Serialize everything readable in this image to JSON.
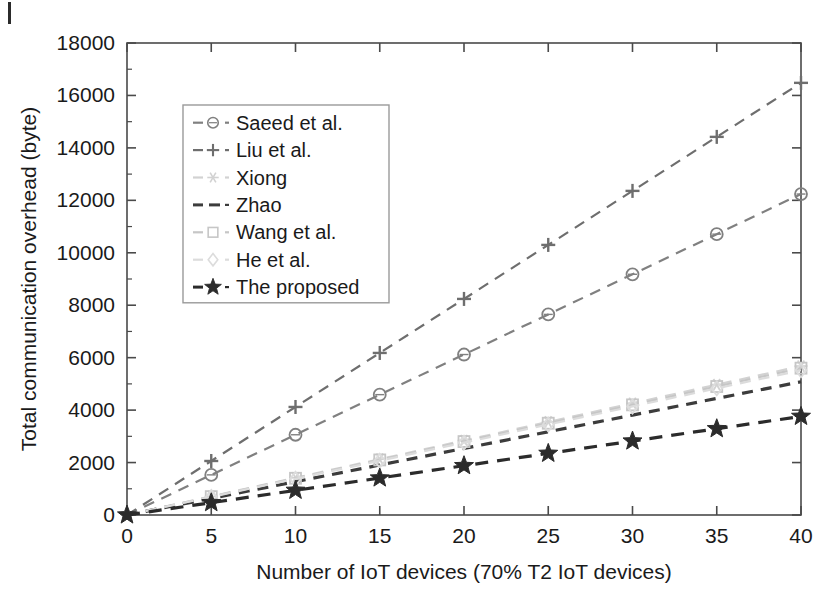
{
  "figure": {
    "background_color": "#ffffff",
    "axis_color": "#4a4a4a",
    "corner_artifact": "scan-artifact"
  },
  "chart_data": {
    "type": "line",
    "title": "",
    "xlabel": "Number of IoT devices (70% T2 IoT devices)",
    "ylabel": "Total communication overhead (byte)",
    "x": [
      0,
      5,
      10,
      15,
      20,
      25,
      30,
      35,
      40
    ],
    "xlim": [
      0,
      40
    ],
    "ylim": [
      0,
      18000
    ],
    "xticks": [
      "0",
      "5",
      "10",
      "15",
      "20",
      "25",
      "30",
      "35",
      "40"
    ],
    "yticks": [
      "0",
      "2000",
      "4000",
      "6000",
      "8000",
      "10000",
      "12000",
      "14000",
      "16000",
      "18000"
    ],
    "grid": false,
    "legend_position": "upper-left-inset",
    "series": [
      {
        "name": "Saeed et al.",
        "marker": "circle",
        "linestyle": "dashed",
        "color": "#808080",
        "values": [
          0,
          1530,
          3060,
          4590,
          6120,
          7650,
          9180,
          10710,
          12240
        ]
      },
      {
        "name": "Liu et al.",
        "marker": "plus",
        "linestyle": "dashed",
        "color": "#6e6e6e",
        "values": [
          0,
          2060,
          4120,
          6180,
          8240,
          10300,
          12360,
          14420,
          16480
        ]
      },
      {
        "name": "Xiong",
        "marker": "asterisk",
        "linestyle": "dashed",
        "color": "#d2d2d2",
        "values": [
          0,
          710,
          1420,
          2130,
          2840,
          3550,
          4260,
          4970,
          5680
        ]
      },
      {
        "name": "Zhao",
        "marker": "none",
        "linestyle": "dashed",
        "color": "#3c3c3c",
        "values": [
          0,
          635,
          1270,
          1905,
          2540,
          3175,
          3810,
          4445,
          5080
        ]
      },
      {
        "name": "Wang et al.",
        "marker": "square",
        "linestyle": "dashed",
        "color": "#c6c6c6",
        "values": [
          0,
          700,
          1400,
          2100,
          2800,
          3500,
          4200,
          4900,
          5600
        ]
      },
      {
        "name": "He et al.",
        "marker": "diamond",
        "linestyle": "dashed",
        "color": "#dcdcdc",
        "values": [
          0,
          690,
          1380,
          2070,
          2760,
          3450,
          4140,
          4830,
          5520
        ]
      },
      {
        "name": "The proposed",
        "marker": "star",
        "linestyle": "dashed",
        "color": "#2b2b2b",
        "values": [
          0,
          470,
          940,
          1410,
          1880,
          2350,
          2820,
          3290,
          3760
        ]
      }
    ]
  },
  "legend": {
    "entries": [
      {
        "label": "Saeed et al.",
        "marker": "circle",
        "color": "#808080"
      },
      {
        "label": "Liu et al.",
        "marker": "plus",
        "color": "#6e6e6e"
      },
      {
        "label": "Xiong",
        "marker": "asterisk",
        "color": "#d2d2d2"
      },
      {
        "label": "Zhao",
        "marker": "none",
        "color": "#3c3c3c"
      },
      {
        "label": "Wang et al.",
        "marker": "square",
        "color": "#c6c6c6"
      },
      {
        "label": "He et al.",
        "marker": "diamond",
        "color": "#dcdcdc"
      },
      {
        "label": "The proposed",
        "marker": "star",
        "color": "#2b2b2b"
      }
    ]
  }
}
